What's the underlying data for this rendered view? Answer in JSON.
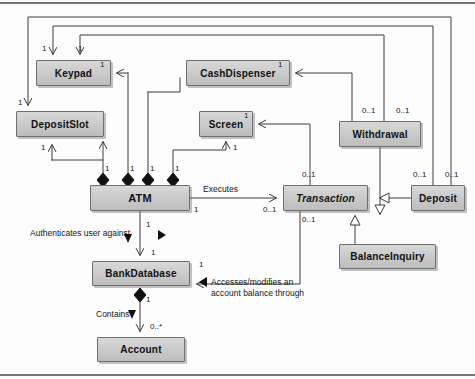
{
  "diagram": {
    "type": "uml-class-diagram",
    "stroke_color": "#3c3c3c",
    "box_fill": "#cccccc",
    "box_border": "#6e6e6e",
    "text_color": "#111111",
    "classes": [
      {
        "id": "keypad",
        "name": "Keypad",
        "abstract": false,
        "x": 36,
        "y": 60,
        "w": 75,
        "h": 26,
        "font_size": 10
      },
      {
        "id": "cashdispenser",
        "name": "CashDispenser",
        "abstract": false,
        "x": 186,
        "y": 60,
        "w": 104,
        "h": 26,
        "font_size": 10
      },
      {
        "id": "depositslot",
        "name": "DepositSlot",
        "abstract": false,
        "x": 16,
        "y": 111,
        "w": 88,
        "h": 26,
        "font_size": 10
      },
      {
        "id": "screen",
        "name": "Screen",
        "abstract": false,
        "x": 199,
        "y": 111,
        "w": 54,
        "h": 26,
        "font_size": 10
      },
      {
        "id": "withdrawal",
        "name": "Withdrawal",
        "abstract": false,
        "x": 339,
        "y": 121,
        "w": 82,
        "h": 26,
        "font_size": 10
      },
      {
        "id": "atm",
        "name": "ATM",
        "abstract": false,
        "x": 90,
        "y": 185,
        "w": 100,
        "h": 26,
        "font_size": 11
      },
      {
        "id": "transaction",
        "name": "Transaction",
        "abstract": true,
        "x": 283,
        "y": 185,
        "w": 85,
        "h": 26,
        "font_size": 10
      },
      {
        "id": "deposit",
        "name": "Deposit",
        "abstract": false,
        "x": 411,
        "y": 185,
        "w": 54,
        "h": 26,
        "font_size": 10
      },
      {
        "id": "balanceinquiry",
        "name": "BalanceInquiry",
        "abstract": false,
        "x": 339,
        "y": 244,
        "w": 97,
        "h": 25,
        "font_size": 10
      },
      {
        "id": "bankdatabase",
        "name": "BankDatabase",
        "abstract": false,
        "x": 92,
        "y": 261,
        "w": 98,
        "h": 25,
        "font_size": 10
      },
      {
        "id": "account",
        "name": "Account",
        "abstract": false,
        "x": 97,
        "y": 337,
        "w": 88,
        "h": 25,
        "font_size": 10
      }
    ],
    "association_labels": [
      {
        "id": "executes",
        "text": "Executes",
        "x": 203,
        "y": 184
      },
      {
        "id": "authenticates",
        "text": "Authenticates user against",
        "x": 30,
        "y": 228
      },
      {
        "id": "contains",
        "text": "Contains",
        "x": 96,
        "y": 309
      },
      {
        "id": "accesses-line-1",
        "text": "Accesses/modifies an",
        "x": 211,
        "y": 278
      },
      {
        "id": "accesses-line-2",
        "text": "account balance through",
        "x": 211,
        "y": 289
      }
    ],
    "multiplicities": [
      {
        "id": "m-keypad-left",
        "text": "1",
        "x": 42,
        "y": 44
      },
      {
        "id": "m-keypad-right",
        "text": "1",
        "x": 78,
        "y": 44
      },
      {
        "id": "m-keypad-assoc",
        "text": "1",
        "x": 100,
        "y": 60
      },
      {
        "id": "m-cashdisp-assoc",
        "text": "1",
        "x": 278,
        "y": 60
      },
      {
        "id": "m-depositslot-top",
        "text": "1",
        "x": 18,
        "y": 98
      },
      {
        "id": "m-depositslot-bot",
        "text": "1",
        "x": 41,
        "y": 143
      },
      {
        "id": "m-screen-assoc",
        "text": "1",
        "x": 244,
        "y": 111
      },
      {
        "id": "m-screen-bot",
        "text": "1",
        "x": 233,
        "y": 143
      },
      {
        "id": "m-atm-d1",
        "text": "1",
        "x": 105,
        "y": 166
      },
      {
        "id": "m-atm-d2",
        "text": "1",
        "x": 129,
        "y": 166
      },
      {
        "id": "m-atm-d3",
        "text": "1",
        "x": 149,
        "y": 166
      },
      {
        "id": "m-atm-d4",
        "text": "1",
        "x": 174,
        "y": 166
      },
      {
        "id": "m-atm-exec",
        "text": "1",
        "x": 194,
        "y": 206
      },
      {
        "id": "m-trans-exec",
        "text": "0..1",
        "x": 263,
        "y": 205
      },
      {
        "id": "m-trans-top",
        "text": "0..1",
        "x": 302,
        "y": 171
      },
      {
        "id": "m-trans-bot",
        "text": "0..1",
        "x": 302,
        "y": 216
      },
      {
        "id": "m-withdrawal-left",
        "text": "0..1",
        "x": 365,
        "y": 107
      },
      {
        "id": "m-withdrawal-right",
        "text": "0..1",
        "x": 398,
        "y": 107
      },
      {
        "id": "m-deposit-left",
        "text": "0..1",
        "x": 415,
        "y": 171
      },
      {
        "id": "m-deposit-right",
        "text": "0..1",
        "x": 447,
        "y": 171
      },
      {
        "id": "m-atm-db-top",
        "text": "1",
        "x": 146,
        "y": 222
      },
      {
        "id": "m-atm-db-bot",
        "text": "1",
        "x": 151,
        "y": 249
      },
      {
        "id": "m-db-accesses",
        "text": "1",
        "x": 199,
        "y": 261
      },
      {
        "id": "m-db-contains",
        "text": "1",
        "x": 146,
        "y": 296
      },
      {
        "id": "m-account",
        "text": "0..*",
        "x": 150,
        "y": 323
      }
    ]
  }
}
